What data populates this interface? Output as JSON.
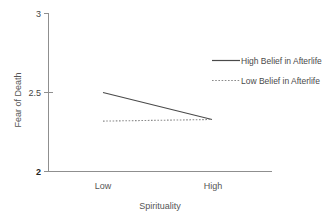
{
  "chart_data": {
    "type": "line",
    "title": "",
    "xlabel": "Spirituality",
    "ylabel": "Fear of Death",
    "categories": [
      "Low",
      "High"
    ],
    "ylim": [
      2,
      3
    ],
    "yticks": [
      2,
      2.5,
      3
    ],
    "ytick_labels": [
      "2",
      "2.5",
      "3"
    ],
    "grid": false,
    "legend_position": "upper right",
    "series": [
      {
        "name": "High Belief in Afterlife",
        "style": "solid",
        "color": "#4a4a4a",
        "values": [
          2.5,
          2.33
        ]
      },
      {
        "name": "Low Belief in Afterlife",
        "style": "dotted",
        "color": "#8a8a8a",
        "values": [
          2.32,
          2.33
        ]
      }
    ]
  },
  "axes": {
    "y_label": "Fear of Death",
    "x_label": "Spirituality",
    "y_tick_top": "3",
    "y_tick_mid": "2.5",
    "y_tick_bottom": "2",
    "x_tick_left": "Low",
    "x_tick_right": "High"
  },
  "legend": {
    "entry_one": "High Belief in Afterlife",
    "entry_two": "Low Belief in Afterlife"
  }
}
